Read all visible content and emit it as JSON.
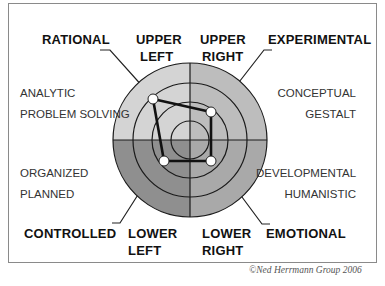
{
  "diagram": {
    "type": "herrmann-whole-brain-model",
    "quadrants": {
      "upper_left": {
        "name_line1": "UPPER",
        "name_line2": "LEFT",
        "style": "RATIONAL",
        "desc_line1": "ANALYTIC",
        "desc_line2": "PROBLEM SOLVING",
        "color": "#d4d4d4"
      },
      "upper_right": {
        "name_line1": "UPPER",
        "name_line2": "RIGHT",
        "style": "EXPERIMENTAL",
        "desc_line1": "CONCEPTUAL",
        "desc_line2": "GESTALT",
        "color": "#bdbdbd"
      },
      "lower_left": {
        "name_line1": "LOWER",
        "name_line2": "LEFT",
        "style": "CONTROLLED",
        "desc_line1": "ORGANIZED",
        "desc_line2": "PLANNED",
        "color": "#8f8f8f"
      },
      "lower_right": {
        "name_line1": "LOWER",
        "name_line2": "RIGHT",
        "style": "EMOTIONAL",
        "desc_line1": "DEVELOPMENTAL",
        "desc_line2": "HUMANISTIC",
        "color": "#a9a9a9"
      }
    },
    "rings": 4,
    "profile_points": [
      {
        "quadrant": "upper_left",
        "ring_level": 4
      },
      {
        "quadrant": "upper_right",
        "ring_level": 3
      },
      {
        "quadrant": "lower_right",
        "ring_level": 3
      },
      {
        "quadrant": "lower_left",
        "ring_level": 3
      }
    ],
    "copyright": "©Ned Herrmann Group 2006"
  }
}
